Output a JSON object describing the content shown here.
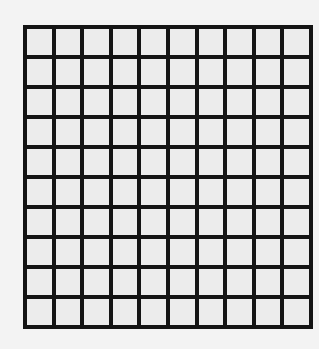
{
  "diagram": {
    "type": "grid",
    "rows": 10,
    "columns": 10,
    "line_color": "#141414",
    "cell_color": "#ececec",
    "background_color": "#f3f3f3",
    "filled_cells": []
  }
}
